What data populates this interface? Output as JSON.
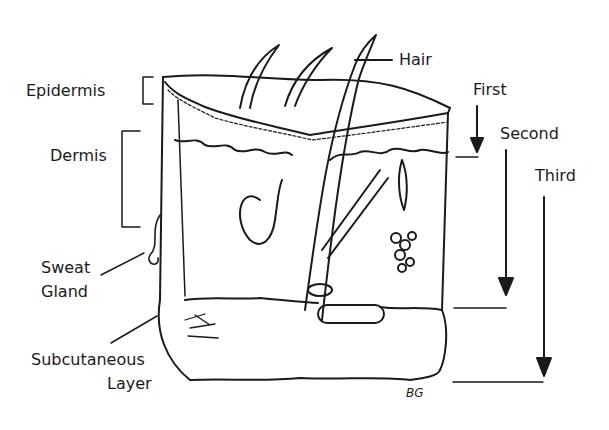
{
  "diagram": {
    "layer_labels": {
      "epidermis": "Epidermis",
      "dermis": "Dermis",
      "sweat_gland_line1": "Sweat",
      "sweat_gland_line2": "Gland",
      "subcutaneous_line1": "Subcutaneous",
      "subcutaneous_line2": "Layer",
      "hair": "Hair"
    },
    "depth_labels": {
      "first": "First",
      "second": "Second",
      "third": "Third"
    },
    "signature": "BG",
    "colors": {
      "ink": "#1a1a1a",
      "background": "#ffffff"
    }
  }
}
